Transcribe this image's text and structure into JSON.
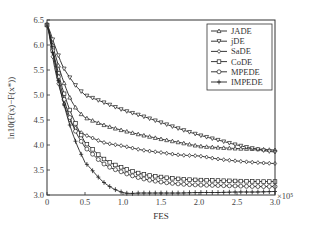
{
  "chart_data": {
    "type": "line",
    "title": "",
    "xlabel": "FES",
    "ylabel": "ln10(F(x)−F(x*))",
    "x_multiplier": "×10⁵",
    "xlim": [
      0,
      3.0
    ],
    "ylim": [
      3.0,
      6.5
    ],
    "xticks": [
      "0",
      "0.5",
      "1.0",
      "1.5",
      "2.0",
      "2.5",
      "3.0"
    ],
    "yticks": [
      "3.0",
      "3.5",
      "4.0",
      "4.5",
      "5.0",
      "5.5",
      "6.0",
      "6.5"
    ],
    "grid": false,
    "legend_position": "upper right",
    "x": [
      0,
      0.1,
      0.2,
      0.3,
      0.4,
      0.5,
      0.75,
      1.0,
      1.25,
      1.5,
      1.75,
      2.0,
      2.25,
      2.5,
      2.75,
      3.0
    ],
    "series": [
      {
        "name": "JADE",
        "marker": "triangle-up",
        "values": [
          6.4,
          5.85,
          5.35,
          4.95,
          4.7,
          4.55,
          4.4,
          4.29,
          4.2,
          4.12,
          4.05,
          3.98,
          3.95,
          3.93,
          3.92,
          3.9
        ]
      },
      {
        "name": "jDE",
        "marker": "triangle-down",
        "values": [
          6.4,
          6.0,
          5.6,
          5.35,
          5.15,
          5.0,
          4.85,
          4.7,
          4.58,
          4.45,
          4.32,
          4.2,
          4.1,
          4.0,
          3.92,
          3.86
        ]
      },
      {
        "name": "SaDE",
        "marker": "diamond",
        "values": [
          6.4,
          5.55,
          4.95,
          4.5,
          4.3,
          4.2,
          4.05,
          3.98,
          3.9,
          3.85,
          3.8,
          3.78,
          3.72,
          3.68,
          3.65,
          3.63
        ]
      },
      {
        "name": "CoDE",
        "marker": "square",
        "values": [
          6.4,
          5.75,
          5.15,
          4.7,
          4.35,
          4.05,
          3.72,
          3.54,
          3.42,
          3.36,
          3.32,
          3.3,
          3.29,
          3.28,
          3.27,
          3.27
        ]
      },
      {
        "name": "MPEDE",
        "marker": "circle",
        "values": [
          6.4,
          5.7,
          5.05,
          4.55,
          4.2,
          3.95,
          3.62,
          3.45,
          3.33,
          3.26,
          3.22,
          3.2,
          3.19,
          3.18,
          3.17,
          3.17
        ]
      },
      {
        "name": "IMPEDE",
        "marker": "plus",
        "values": [
          6.4,
          5.65,
          4.95,
          4.4,
          3.98,
          3.65,
          3.25,
          3.05,
          3.04,
          3.04,
          3.04,
          3.05,
          3.05,
          3.06,
          3.06,
          3.07
        ]
      }
    ]
  },
  "legend": {
    "items": [
      "JADE",
      "jDE",
      "SaDE",
      "CoDE",
      "MPEDE",
      "IMPEDE"
    ]
  },
  "axes": {
    "xlabel": "FES",
    "ylabel": "ln10(F(x)−F(x*))",
    "x_multiplier": "×10⁵"
  }
}
